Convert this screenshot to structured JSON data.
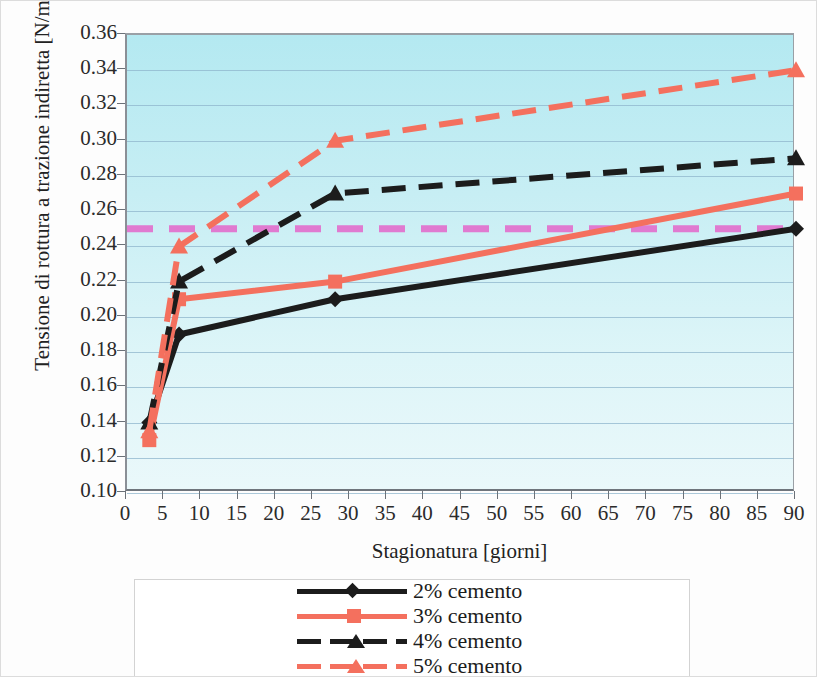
{
  "chart_data": {
    "type": "line",
    "title": "",
    "xlabel": "Stagionatura [giorni]",
    "ylabel": "Tensione di rottura a trazione indiretta [N/mm^2]",
    "xlim": [
      0,
      90
    ],
    "ylim": [
      0.1,
      0.36
    ],
    "xticks": [
      0,
      5,
      10,
      15,
      20,
      25,
      30,
      35,
      40,
      45,
      50,
      55,
      60,
      65,
      70,
      75,
      80,
      85,
      90
    ],
    "ytick_labels": [
      "0.36",
      "0.34",
      "0.32",
      "0.30",
      "0.28",
      "0.26",
      "0.24",
      "0.22",
      "0.20",
      "0.18",
      "0.16",
      "0.14",
      "0.12",
      "0.10"
    ],
    "yticks": [
      0.36,
      0.34,
      0.32,
      0.3,
      0.28,
      0.26,
      0.24,
      0.22,
      0.2,
      0.18,
      0.16,
      0.14,
      0.12,
      0.1
    ],
    "grid": true,
    "legend_position": "bottom",
    "plot_background": "#cdeff5",
    "gridline_color": "#8fb6cc",
    "x": [
      3,
      7,
      28,
      90
    ],
    "series": [
      {
        "name": "2% cemento",
        "values": [
          0.14,
          0.19,
          0.21,
          0.25
        ],
        "color": "#1c1c1c",
        "style": "solid",
        "marker": "diamond"
      },
      {
        "name": "3% cemento",
        "values": [
          0.13,
          0.21,
          0.22,
          0.27
        ],
        "color": "#f4705e",
        "style": "solid",
        "marker": "square"
      },
      {
        "name": "4% cemento",
        "values": [
          0.14,
          0.22,
          0.27,
          0.29
        ],
        "color": "#1c1c1c",
        "style": "dashed",
        "marker": "triangle"
      },
      {
        "name": "5% cemento",
        "values": [
          0.135,
          0.24,
          0.3,
          0.34
        ],
        "color": "#f4705e",
        "style": "dashed",
        "marker": "triangle"
      }
    ],
    "threshold_line": {
      "label": "",
      "value": 0.25,
      "color": "#e07ad0",
      "style": "dashed"
    }
  },
  "legend": {
    "items": [
      {
        "label": "2% cemento"
      },
      {
        "label": "3% cemento"
      },
      {
        "label": "4% cemento"
      },
      {
        "label": "5% cemento"
      }
    ]
  }
}
